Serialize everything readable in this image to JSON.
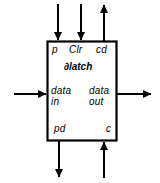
{
  "diagram": {
    "type": "block-diagram",
    "stroke_color": "#000000",
    "fill_color": "#ffffff",
    "block": {
      "name": "∂latch",
      "x": 47,
      "y": 41,
      "width": 70,
      "height": 100
    },
    "ports": {
      "top_left": {
        "label": "p",
        "direction": "in"
      },
      "top_center": {
        "label": "Clr",
        "direction": "in"
      },
      "top_right": {
        "label": "cd",
        "direction": "out"
      },
      "left": {
        "label_line1": "data",
        "label_line2": "in",
        "direction": "in"
      },
      "right": {
        "label_line1": "data",
        "label_line2": "out",
        "direction": "out"
      },
      "bottom_left": {
        "label": "pd",
        "direction": "out"
      },
      "bottom_right": {
        "label": "c",
        "direction": "in"
      }
    },
    "arrows": [
      {
        "name": "arrow-p-in",
        "x1": 58,
        "y1": 4,
        "x2": 58,
        "y2": 41,
        "head": "end"
      },
      {
        "name": "arrow-clr-in",
        "x1": 81,
        "y1": 4,
        "x2": 81,
        "y2": 41,
        "head": "end"
      },
      {
        "name": "arrow-cd-out",
        "x1": 104,
        "y1": 41,
        "x2": 104,
        "y2": 4,
        "head": "end"
      },
      {
        "name": "arrow-datain-in",
        "x1": 14,
        "y1": 94,
        "x2": 47,
        "y2": 94,
        "head": "end"
      },
      {
        "name": "arrow-dataout-out",
        "x1": 117,
        "y1": 94,
        "x2": 152,
        "y2": 94,
        "head": "end"
      },
      {
        "name": "arrow-pd-out",
        "x1": 59,
        "y1": 141,
        "x2": 59,
        "y2": 178,
        "head": "end"
      },
      {
        "name": "arrow-c-in",
        "x1": 104,
        "y1": 178,
        "x2": 104,
        "y2": 141,
        "head": "end"
      }
    ]
  }
}
